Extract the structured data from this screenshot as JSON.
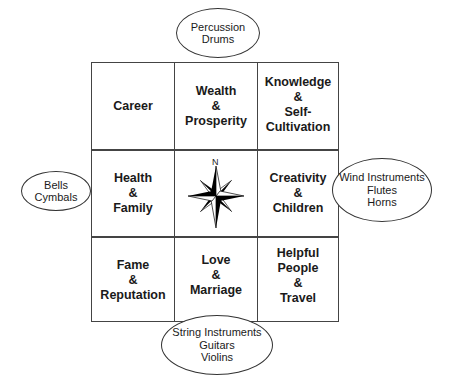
{
  "diagram": {
    "grid": {
      "cells": [
        {
          "id": "career",
          "label": "Career",
          "row": 0,
          "col": 0
        },
        {
          "id": "wealth",
          "label": "Wealth\n&\nProsperity",
          "row": 0,
          "col": 1
        },
        {
          "id": "knowledge",
          "label": "Knowledge\n&\nSelf-\nCultivation",
          "row": 0,
          "col": 2
        },
        {
          "id": "health",
          "label": "Health\n&\nFamily",
          "row": 1,
          "col": 0
        },
        {
          "id": "center",
          "label": "",
          "row": 1,
          "col": 1,
          "icon": "compass-rose-icon"
        },
        {
          "id": "creativity",
          "label": "Creativity\n&\nChildren",
          "row": 1,
          "col": 2
        },
        {
          "id": "fame",
          "label": "Fame\n&\nReputation",
          "row": 2,
          "col": 0
        },
        {
          "id": "love",
          "label": "Love\n&\nMarriage",
          "row": 2,
          "col": 1
        },
        {
          "id": "helpful",
          "label": "Helpful\nPeople\n&\nTravel",
          "row": 2,
          "col": 2
        }
      ]
    },
    "compass": {
      "north_label": "N"
    },
    "ellipses": {
      "top": {
        "label": "Percussion\nDrums"
      },
      "left": {
        "label": "Bells\nCymbals"
      },
      "right": {
        "label": "Wind Instruments\nFlutes\nHorns"
      },
      "bottom": {
        "label": "String Instruments\nGuitars\nViolins"
      }
    },
    "colors": {
      "line": "#444444",
      "text": "#1a1a1a",
      "background": "#ffffff"
    }
  }
}
